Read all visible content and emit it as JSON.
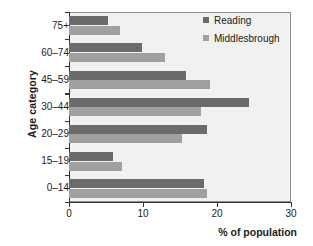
{
  "chart_data": {
    "type": "bar",
    "orientation": "horizontal",
    "title": "",
    "xlabel": "% of population",
    "ylabel": "Age category",
    "categories": [
      "0–14",
      "15–19",
      "20–29",
      "30–44",
      "45–59",
      "60–74",
      "75+"
    ],
    "series": [
      {
        "name": "Reading",
        "color": "#6b6b6b",
        "values": [
          18.2,
          6.0,
          18.7,
          24.3,
          15.8,
          9.9,
          5.3
        ]
      },
      {
        "name": "Middlesbrough",
        "color": "#a0a0a0",
        "values": [
          18.7,
          7.2,
          15.3,
          17.8,
          19.0,
          13.0,
          6.9
        ]
      }
    ],
    "xlim": [
      0,
      30
    ],
    "xticks": [
      0,
      10,
      20,
      30
    ],
    "xtick_labels": [
      "0",
      "10",
      "20",
      "30"
    ],
    "grid": false,
    "legend_position": "top-right",
    "plot_background": "#f1f1ef"
  },
  "legend": {
    "entries": [
      {
        "label": "Reading"
      },
      {
        "label": "Middlesbrough"
      }
    ]
  }
}
